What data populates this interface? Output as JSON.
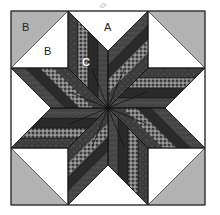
{
  "colors": {
    "background": "#ffffff",
    "corner_gray": "#b3b3b3",
    "white_piece": "#ffffff",
    "outline": "#333333",
    "strips": [
      "#3b3b3b",
      "#8c8c8c",
      "#2a2a2a",
      "#454545"
    ]
  },
  "strip_fabrics": [
    "dark-paisley",
    "gingham-check",
    "solid-dark",
    "dark-print"
  ],
  "pieces": {
    "corner_triangle_gray": "B",
    "corner_triangle_white": "B",
    "side_triangle": "A",
    "strip_diamond": "C"
  },
  "labels": {
    "corner_outer": "B",
    "corner_inner": "B",
    "side": "A",
    "diamond": "C"
  },
  "star_points": 8,
  "strips_per_point": 4,
  "signature_mark": "~"
}
